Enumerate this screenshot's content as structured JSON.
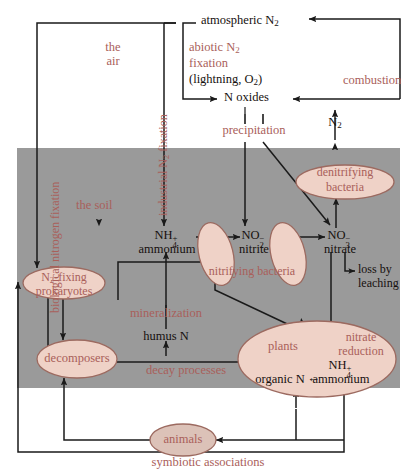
{
  "diagram": {
    "colors": {
      "soil_band": "#9a9a9a",
      "ellipse_fill": "#efd2c7",
      "ellipse_stroke": "#9c6a60",
      "text_rose": "#a9605a",
      "text_dark": "#16100e",
      "line": "#1a1a1a",
      "background": "#ffffff"
    },
    "zones": {
      "air_label": "the\nair",
      "air_line1": "the",
      "air_line2": "air",
      "soil_label": "the soil"
    },
    "nodes": {
      "atmospheric_n2": "atmospheric N",
      "atmospheric_n2_sub": "2",
      "n_oxides": "N oxides",
      "n2_combustion": "N",
      "n2_combustion_sub": "2",
      "ammonium_formula": "NH",
      "ammonium_sub": "4",
      "ammonium_sup": "+",
      "ammonium_name": "ammonium",
      "nitrite_formula": "NO",
      "nitrite_sub": "2",
      "nitrite_sup": "−",
      "nitrite_name": "nitrite",
      "nitrate_formula": "NO",
      "nitrate_sub": "3",
      "nitrate_sup": "−",
      "nitrate_name": "nitrate",
      "humus_n": "humus N",
      "organic_n": "organic N",
      "plants_ammonium_formula": "NH",
      "plants_ammonium_sub": "4",
      "plants_ammonium_sup": "+",
      "plants_ammonium_name": "ammonium"
    },
    "organisms": [
      {
        "id": "denitrifying-bacteria",
        "line1": "denitrifying",
        "line2": "bacteria"
      },
      {
        "id": "nitrifying-bacteria",
        "line1": "nitrifying bacteria",
        "line2": ""
      },
      {
        "id": "n2-fixing-prokaryotes",
        "line1": "N2-fixing",
        "line2": "prokaryotes"
      },
      {
        "id": "decomposers",
        "line1": "decomposers",
        "line2": ""
      },
      {
        "id": "plants",
        "line1": "plants",
        "line2": ""
      },
      {
        "id": "animals",
        "line1": "animals",
        "line2": ""
      }
    ],
    "n2_fixing_prefix": "N",
    "n2_fixing_sub": "2",
    "n2_fixing_suffix": "-fixing",
    "n2_fixing_line2": "prokaryotes",
    "processes": {
      "biological_nitrogen_fixation": "biological nitrogen fixation",
      "industrial_n2_fixation_a": "industrial N",
      "industrial_n2_fixation_sub": "2",
      "industrial_n2_fixation_b": " fixation",
      "abiotic_line1_a": "abiotic N",
      "abiotic_line1_sub": "2",
      "abiotic_line2": "fixation",
      "abiotic_line3_a": "(lightning, O",
      "abiotic_line3_sub": "2",
      "abiotic_line3_b": ")",
      "combustion": "combustion",
      "precipitation": "precipitation",
      "mineralization": "mineralization",
      "decay_processes": "decay processes",
      "nitrate_reduction_line1": "nitrate",
      "nitrate_reduction_line2": "reduction",
      "loss_by_leaching_line1": "loss by",
      "loss_by_leaching_line2": "leaching",
      "symbiotic_associations": "symbiotic associations"
    }
  }
}
